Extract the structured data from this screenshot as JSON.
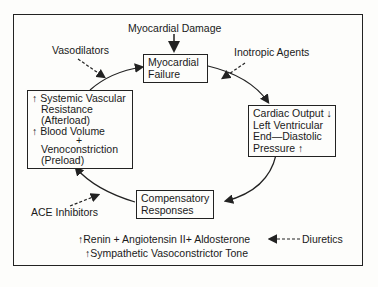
{
  "diagram": {
    "top_label": "Myocardial Damage",
    "vasodilators": "Vasodilators",
    "inotropic": "Inotropic Agents",
    "ace": "ACE Inhibitors",
    "diuretics": "Diuretics",
    "boxes": {
      "failure": [
        "Myocardial",
        "Failure"
      ],
      "cardiac": [
        "Cardiac Output ↓",
        "Left Ventricular",
        "End—Diastolic",
        "Pressure ↑"
      ],
      "systemic": [
        "↑ Systemic Vascular",
        "Resistance",
        "(Afterload)",
        "↑ Blood Volume",
        "+",
        "Venoconstriction",
        "(Preload)"
      ],
      "compensatory": [
        "Compensatory",
        "Responses"
      ]
    },
    "bottom_line1": "↑Renin  + Angiotensin II+  Aldosterone",
    "bottom_line2": "↑Sympathetic Vasoconstrictor Tone"
  }
}
